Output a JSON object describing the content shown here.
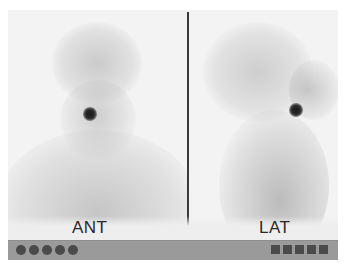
{
  "figure": {
    "panels": [
      {
        "id": "ant",
        "label": "ANT",
        "hotspot": "focal-uptake"
      },
      {
        "id": "lat",
        "label": "LAT",
        "hotspot": "focal-uptake"
      }
    ],
    "footer_bar": {
      "left_markers": {
        "shape": "circle",
        "count": 5
      },
      "right_markers": {
        "shape": "square",
        "count": 5
      }
    },
    "colors": {
      "background": "#f3f3f3",
      "divider": "#3a3a3a",
      "bar": "#9a9a9a",
      "markers": "#4a4a4a",
      "hotspot": "#1a1a1a"
    }
  }
}
